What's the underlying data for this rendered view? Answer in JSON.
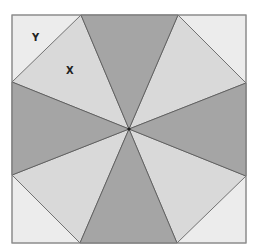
{
  "diagram": {
    "labels": [
      {
        "text": "Y",
        "region": "top-left corner triangle"
      },
      {
        "text": "X",
        "region": "upper-left light triangle"
      }
    ],
    "colors": {
      "dark": "#a5a5a5",
      "light": "#d9d9d9",
      "corner": "#ececec",
      "stroke": "#555555",
      "border": "#8c8c8c"
    }
  }
}
